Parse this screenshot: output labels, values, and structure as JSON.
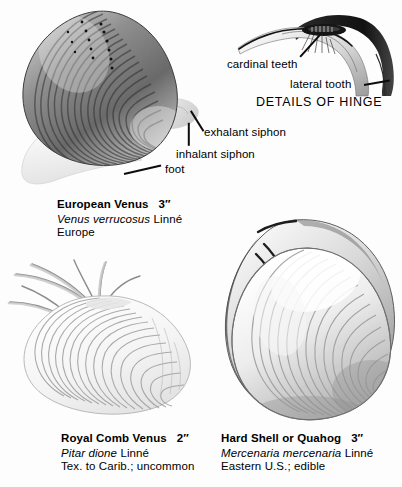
{
  "plate": {
    "background_color": "#fdfdfd",
    "ink_color": "#0c0c0c"
  },
  "hinge_detail": {
    "title": "DETAILS OF HINGE",
    "annotations": [
      {
        "name": "cardinal-teeth",
        "label": "cardinal teeth"
      },
      {
        "name": "lateral-tooth",
        "label": "lateral tooth"
      }
    ]
  },
  "anatomy_annotations": [
    {
      "name": "exhalant-siphon",
      "label": "exhalant siphon"
    },
    {
      "name": "inhalant-siphon",
      "label": "inhalant siphon"
    },
    {
      "name": "foot",
      "label": "foot"
    }
  ],
  "specimens": [
    {
      "id": "european-venus",
      "common_name": "European Venus",
      "size": "3″",
      "scientific_name": "Venus verrucosus",
      "authority": "Linné",
      "range": "Europe"
    },
    {
      "id": "royal-comb-venus",
      "common_name": "Royal Comb Venus",
      "size": "2″",
      "scientific_name": "Pitar dione",
      "authority": "Linné",
      "range": "Tex. to Carib.; uncommon"
    },
    {
      "id": "hard-shell-quahog",
      "common_name": "Hard Shell or Quahog",
      "size": "3″",
      "scientific_name": "Mercenaria mercenaria",
      "authority": "Linné",
      "range": "Eastern U.S.; edible"
    }
  ]
}
